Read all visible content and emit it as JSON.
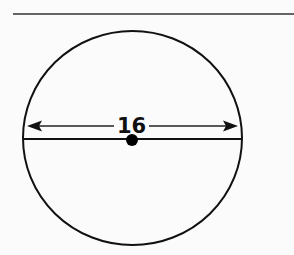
{
  "figure": {
    "type": "circle-diameter",
    "diameter_label": "16",
    "colors": {
      "background": "#fbfbfb",
      "stroke": "#111111"
    },
    "elements": {
      "top_rule": "horizontal line across top",
      "circle": "circle outline",
      "diameter_line": "horizontal chord through center",
      "dimension_arrow": "double-headed arrow spanning diameter",
      "center_point": "filled center dot"
    }
  }
}
